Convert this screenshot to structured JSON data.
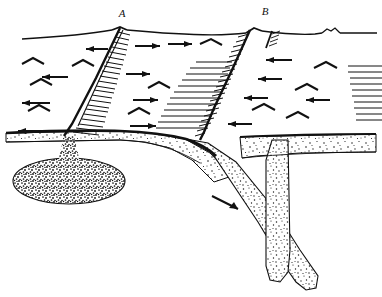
{
  "figure": {
    "type": "geologic-cross-section",
    "title": "",
    "background_color": "#ffffff",
    "ink_color": "#111111",
    "width": 382,
    "height": 297
  },
  "labels": [
    {
      "id": "A",
      "text": "A",
      "x": 124,
      "y": 16,
      "描": "fault-label-a"
    },
    {
      "id": "B",
      "text": "B",
      "x": 265,
      "y": 13,
      "描": "fault-label-b"
    }
  ],
  "features": {
    "ground_surface": "land surface profile",
    "crust_layer": "stippled crustal layer",
    "magma_chamber": "stippled elliptical magma body",
    "descending_slab": "downgoing stippled slab",
    "vertical_conduit": "vertical stippled conduit",
    "fault_a": "normal fault with hachures (A)",
    "fault_b": "normal fault with hachures (B)",
    "small_fault_right": "short hachured fault right of B",
    "surface_bump": "small surface mound at right",
    "extension_arrows": "divergence arrows in upper block",
    "slab_arrow": "downward motion arrow on slab"
  },
  "legend": {
    "arrow_meaning": "relative movement direction",
    "hachure_meaning": "downthrown side of fault",
    "stipple_meaning": "crustal / magmatic material"
  }
}
